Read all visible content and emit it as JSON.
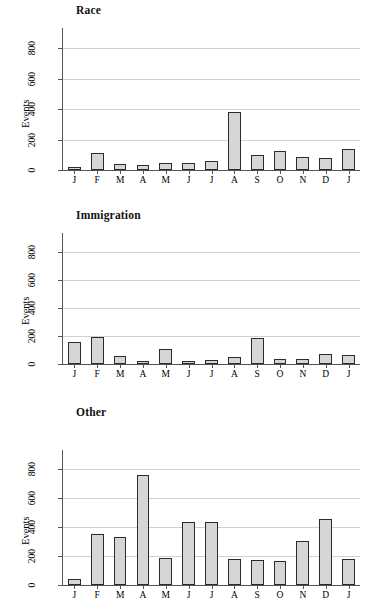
{
  "figure": {
    "ylabel": "Events",
    "background": "#ffffff",
    "bar_fill": "#d6d6d6",
    "bar_stroke": "#2b2b2b",
    "grid_color": "#d0d0d0"
  },
  "chart_data": [
    {
      "type": "bar",
      "title": "Race",
      "xlabel": "",
      "ylabel": "Events",
      "categories": [
        "J",
        "F",
        "M",
        "A",
        "M",
        "J",
        "J",
        "A",
        "S",
        "O",
        "N",
        "D",
        "J"
      ],
      "values": [
        15,
        112,
        40,
        30,
        43,
        48,
        57,
        380,
        97,
        128,
        85,
        80,
        140
      ],
      "ylim": [
        0,
        900
      ],
      "yticks": [
        0,
        200,
        400,
        600,
        800
      ],
      "ytick_labels": [
        "0",
        "200",
        "400",
        "600",
        "800"
      ],
      "grid": true,
      "legend": "none"
    },
    {
      "type": "bar",
      "title": "Immigration",
      "xlabel": "",
      "ylabel": "Events",
      "categories": [
        "J",
        "F",
        "M",
        "A",
        "M",
        "J",
        "J",
        "A",
        "S",
        "O",
        "N",
        "D",
        "J"
      ],
      "values": [
        158,
        192,
        57,
        25,
        110,
        25,
        30,
        50,
        183,
        35,
        38,
        75,
        62
      ],
      "ylim": [
        0,
        900
      ],
      "yticks": [
        0,
        200,
        400,
        600,
        800
      ],
      "ytick_labels": [
        "0",
        "200",
        "400",
        "600",
        "800"
      ],
      "grid": true,
      "legend": "none"
    },
    {
      "type": "bar",
      "title": "Other",
      "xlabel": "",
      "ylabel": "Events",
      "categories": [
        "J",
        "F",
        "M",
        "A",
        "M",
        "J",
        "J",
        "A",
        "S",
        "O",
        "N",
        "D",
        "J"
      ],
      "values": [
        40,
        350,
        330,
        760,
        190,
        435,
        435,
        180,
        170,
        165,
        305,
        460,
        180
      ],
      "ylim": [
        0,
        900
      ],
      "yticks": [
        0,
        200,
        400,
        600,
        800
      ],
      "ytick_labels": [
        "0",
        "200",
        "400",
        "600",
        "800"
      ],
      "grid": true,
      "legend": "none"
    }
  ]
}
